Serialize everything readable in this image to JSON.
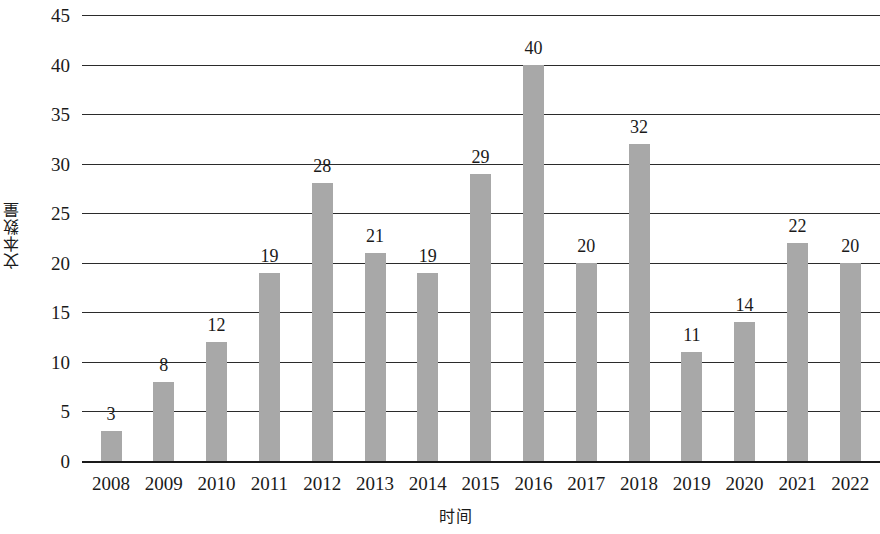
{
  "chart_data": {
    "type": "bar",
    "title": "",
    "xlabel": "时间",
    "ylabel": "文本数量",
    "categories": [
      "2008",
      "2009",
      "2010",
      "2011",
      "2012",
      "2013",
      "2014",
      "2015",
      "2016",
      "2017",
      "2018",
      "2019",
      "2020",
      "2021",
      "2022"
    ],
    "values": [
      3,
      8,
      12,
      19,
      28,
      21,
      19,
      29,
      40,
      20,
      32,
      11,
      14,
      22,
      20
    ],
    "data_labels": [
      "3",
      "8",
      "12",
      "19",
      "28",
      "21",
      "19",
      "29",
      "40",
      "20",
      "32",
      "11",
      "14",
      "22",
      "20"
    ],
    "ylim": [
      0,
      45
    ],
    "ytick_values": [
      0,
      5,
      10,
      15,
      20,
      25,
      30,
      35,
      40,
      45
    ],
    "ytick_labels": [
      "0",
      "5",
      "10",
      "15",
      "20",
      "25",
      "30",
      "35",
      "40",
      "45"
    ],
    "grid": true,
    "legend": false,
    "bar_color": "#a8a8a8",
    "axis_color": "#1a1a1a",
    "background_color": "#ffffff"
  }
}
